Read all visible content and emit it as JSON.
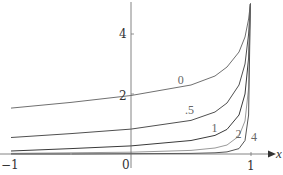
{
  "chart_data": {
    "type": "line",
    "title": "",
    "xlabel": "x",
    "ylabel": "",
    "xlim": [
      -1,
      1.15
    ],
    "ylim": [
      0,
      5
    ],
    "grid": false,
    "legend": "inline curve labels",
    "x_ticks": [
      {
        "value": -1,
        "label": "−1"
      },
      {
        "value": 0,
        "label": "0"
      },
      {
        "value": 1,
        "label": "1"
      }
    ],
    "y_ticks": [
      {
        "value": 2,
        "label": "2"
      },
      {
        "value": 4,
        "label": "4"
      }
    ],
    "x": [
      -1,
      -0.5,
      0,
      0.5,
      0.7,
      0.8,
      0.9,
      0.95,
      0.98,
      0.995
    ],
    "series": [
      {
        "name": "0",
        "label": "0",
        "color": "#707070",
        "label_pos": [
          0.39,
          2.35
        ],
        "values": [
          1.53,
          1.72,
          1.95,
          2.3,
          2.6,
          2.9,
          3.4,
          3.9,
          4.5,
          5.0
        ]
      },
      {
        "name": ".5",
        "label": ".5",
        "color": "#505050",
        "label_pos": [
          0.45,
          1.35
        ],
        "values": [
          0.55,
          0.68,
          0.83,
          1.12,
          1.4,
          1.7,
          2.3,
          3.0,
          4.0,
          5.0
        ]
      },
      {
        "name": "1",
        "label": "1",
        "color": "#3a3a3a",
        "label_pos": [
          0.67,
          0.75
        ],
        "values": [
          0.1,
          0.18,
          0.27,
          0.45,
          0.62,
          0.82,
          1.3,
          2.0,
          3.2,
          5.0
        ]
      },
      {
        "name": "2",
        "label": "2",
        "color": "#9a9a9a",
        "label_pos": [
          0.87,
          0.52
        ],
        "values": [
          0.02,
          0.04,
          0.06,
          0.12,
          0.2,
          0.3,
          0.6,
          1.1,
          2.2,
          5.0
        ]
      },
      {
        "name": "4",
        "label": "4",
        "color": "#555555",
        "label_pos": [
          1.0,
          0.45
        ],
        "values": [
          0.0,
          0.0,
          0.01,
          0.02,
          0.04,
          0.07,
          0.18,
          0.45,
          1.3,
          5.0
        ]
      }
    ]
  },
  "axes": {
    "x_label": "x",
    "tick_x_neg1": "−1",
    "tick_x_0": "0",
    "tick_x_1": "1",
    "tick_y_2": "2",
    "tick_y_4": "4"
  }
}
